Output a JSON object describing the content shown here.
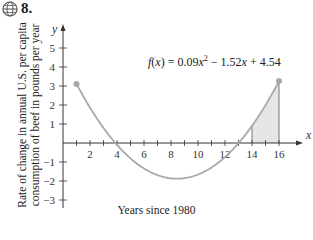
{
  "header": {
    "problem_number": "8.",
    "icon": "globe-icon"
  },
  "chart_data": {
    "type": "line",
    "title": "",
    "function_label": "f(x) = 0.09x² − 1.52x + 4.54",
    "function": {
      "a": 0.09,
      "b": -1.52,
      "c": 4.54
    },
    "xlabel": "Years since 1980",
    "ylabel": "Rate of change in annual U.S. per capita consumption of beef in pounds per year",
    "xlim": [
      0,
      17
    ],
    "ylim": [
      -3.5,
      6
    ],
    "x_ticks": [
      2,
      4,
      6,
      8,
      10,
      12,
      14,
      16
    ],
    "y_ticks": [
      -3,
      -2,
      -1,
      1,
      2,
      3,
      4,
      5
    ],
    "x_axis_name": "x",
    "y_axis_name": "y",
    "domain": [
      1,
      16
    ],
    "endpoints": [
      {
        "x": 1,
        "y": 3.11
      },
      {
        "x": 16,
        "y": 3.34
      }
    ],
    "shaded_region": {
      "from": 14,
      "to": 16
    },
    "x_intercepts": [
      3.9,
      13.0
    ],
    "minimum": {
      "x": 8.44,
      "y": -1.88
    },
    "grid": false,
    "colors": {
      "curve": "#a8a8a8",
      "shade": "#e6e6e6",
      "axis": "#333333"
    }
  },
  "formula": {
    "f": "f",
    "x1": "x",
    "rest1": ") = 0.09",
    "x2": "x",
    "sup": "2",
    "rest2": " − 1.52",
    "x3": "x",
    "rest3": " + 4.54"
  },
  "labels": {
    "x_axis": "Years since 1980",
    "y_axis_line1": "Rate of change in annual U.S. per capita",
    "y_axis_line2": "consumption of beef in pounds per year"
  }
}
